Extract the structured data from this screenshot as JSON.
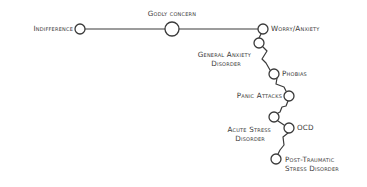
{
  "diagram": {
    "colors": {
      "line": "#3a3a3a",
      "text": "#3a3a3a",
      "background": "#ffffff"
    },
    "nodes": [
      {
        "id": "indifference",
        "label": "Indifference",
        "x": 80,
        "y": 29,
        "r": 5
      },
      {
        "id": "godly-concern",
        "label": "Godly concern",
        "x": 172,
        "y": 29,
        "r": 7
      },
      {
        "id": "worry-anxiety",
        "label": "Worry/Anxiety",
        "x": 263,
        "y": 29,
        "r": 5
      },
      {
        "id": "general-anxiety-disorder",
        "label_line1": "General Anxiety",
        "label_line2": "Disorder",
        "x": 259,
        "y": 43,
        "r": 5
      },
      {
        "id": "phobias",
        "label": "Phobias",
        "x": 274,
        "y": 74,
        "r": 5
      },
      {
        "id": "panic-attacks",
        "label": "Panic Attacks",
        "x": 289,
        "y": 96,
        "r": 5
      },
      {
        "id": "acute-stress-disorder",
        "label_line1": "Acute Stress",
        "label_line2": "Disorder",
        "x": 274,
        "y": 117,
        "r": 5
      },
      {
        "id": "ocd",
        "label": "OCD",
        "x": 289,
        "y": 128,
        "r": 5
      },
      {
        "id": "ptsd",
        "label_line1": "Post-Traumatic",
        "label_line2": "Stress Disorder",
        "x": 276,
        "y": 159,
        "r": 5
      }
    ],
    "edges": [
      [
        "indifference",
        "godly-concern"
      ],
      [
        "godly-concern",
        "worry-anxiety"
      ],
      [
        "worry-anxiety",
        "general-anxiety-disorder"
      ],
      [
        "general-anxiety-disorder",
        "phobias"
      ],
      [
        "phobias",
        "panic-attacks"
      ],
      [
        "panic-attacks",
        "acute-stress-disorder"
      ],
      [
        "acute-stress-disorder",
        "ocd"
      ],
      [
        "ocd",
        "ptsd"
      ]
    ]
  }
}
